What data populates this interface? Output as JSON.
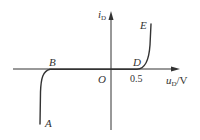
{
  "diagram": {
    "colors": {
      "axis": "#333333",
      "curve": "#333333",
      "background": "#ffffff"
    },
    "axes": {
      "y": {
        "label_main": "i",
        "label_sub": "D"
      },
      "x": {
        "label_main": "u",
        "label_sub": "D",
        "label_unit": "/V"
      },
      "origin": "O",
      "x_tick": "0.5"
    },
    "points": {
      "A": "A",
      "B": "B",
      "D": "D",
      "E": "E"
    }
  }
}
